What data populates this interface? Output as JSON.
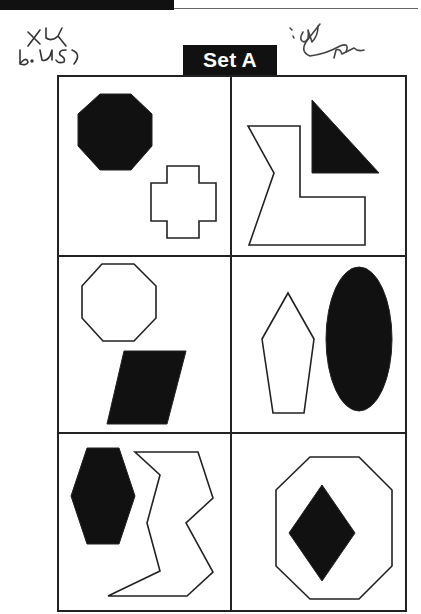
{
  "header": {
    "title": "Set A",
    "annotations": [
      {
        "name": "handwritten-note-left",
        "text": "+4 b. 45)"
      },
      {
        "name": "handwritten-note-right",
        "text": "signature scribble"
      }
    ]
  },
  "colors": {
    "ink": "#111111",
    "paper": "#ffffff",
    "line": "#222222"
  },
  "grid": {
    "rows": 3,
    "cols": 2,
    "bounds": {
      "x0": 58,
      "y0": 76,
      "x1": 406,
      "y1": 611
    },
    "dividers": {
      "vx": 231,
      "hy": [
        256,
        433
      ]
    }
  },
  "cells": [
    {
      "id": "r1c1",
      "shapes": [
        {
          "name": "filled-octagon",
          "fill": "black",
          "points": "100,94 131,94 152,114 152,146 131,170 100,170 78,146 78,114"
        },
        {
          "name": "outline-cross",
          "fill": "none",
          "points": "167,166 199,166 199,183 216,183 216,221 199,221 199,238 167,238 167,221 151,221 151,183 167,183"
        }
      ]
    },
    {
      "id": "r1c2",
      "shapes": [
        {
          "name": "filled-right-triangle",
          "fill": "black",
          "points": "312,100 379,173 312,173"
        },
        {
          "name": "outline-l-shape",
          "fill": "none",
          "points": "248,126 300,126 300,197 365,197 365,245 249,245 274,173"
        }
      ]
    },
    {
      "id": "r2c1",
      "shapes": [
        {
          "name": "outline-octagon",
          "fill": "none",
          "points": "102,264 134,264 156,286 156,318 134,341 103,341 82,318 82,286"
        },
        {
          "name": "filled-parallelogram",
          "fill": "black",
          "points": "124,351 186,351 167,424 107,424"
        }
      ]
    },
    {
      "id": "r2c2",
      "shapes": [
        {
          "name": "outline-pentagon",
          "fill": "none",
          "points": "288,293 314,339 304,413 273,413 262,339"
        },
        {
          "name": "filled-ellipse",
          "fill": "black",
          "ellipse": {
            "cx": 359,
            "cy": 339,
            "rx": 33,
            "ry": 72
          }
        }
      ]
    },
    {
      "id": "r3c1",
      "shapes": [
        {
          "name": "filled-hexagon",
          "fill": "black",
          "points": "87,448 119,448 135,496 119,544 87,544 71,496"
        },
        {
          "name": "outline-zigzag-shape",
          "fill": "none",
          "points": "135,452 198,452 213,498 186,523 213,572 187,596 108,596 160,571 147,523 160,475"
        }
      ]
    },
    {
      "id": "r3c2",
      "shapes": [
        {
          "name": "outline-large-octagon",
          "fill": "none",
          "points": "310,457 359,457 392,490 392,566 359,599 310,599 276,566 276,490"
        },
        {
          "name": "filled-diamond",
          "fill": "black",
          "points": "322,485 355,533 322,581 289,533"
        }
      ]
    }
  ]
}
